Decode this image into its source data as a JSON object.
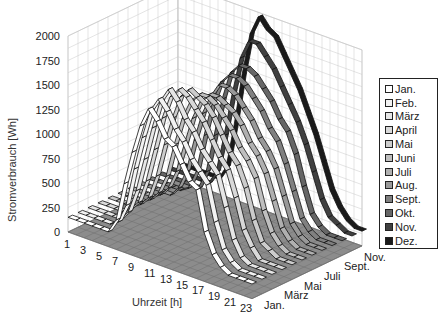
{
  "chart_data": {
    "type": "area",
    "subtype": "3d-ribbon",
    "title": "",
    "xlabel": "Uhrzeit [h]",
    "ylabel": "Monat",
    "zlabel": "Stromverbrauch [Wh]",
    "zlim": [
      0,
      2000
    ],
    "z_ticks": [
      "0",
      "250",
      "500",
      "750",
      "1000",
      "1250",
      "1500",
      "1750",
      "2000"
    ],
    "x_ticks": [
      "1",
      "3",
      "5",
      "7",
      "9",
      "11",
      "13",
      "15",
      "17",
      "19",
      "21",
      "23"
    ],
    "y_ticks": [
      "Jan.",
      "März",
      "Mai",
      "Juli",
      "Sept.",
      "Nov."
    ],
    "grid": true,
    "legend_position": "right",
    "x": [
      1,
      2,
      3,
      4,
      5,
      6,
      7,
      8,
      9,
      10,
      11,
      12,
      13,
      14,
      15,
      16,
      17,
      18,
      19,
      20,
      21,
      22,
      23,
      24
    ],
    "series": [
      {
        "name": "Jan.",
        "color": "#ffffff",
        "values": [
          150,
          150,
          150,
          150,
          150,
          150,
          300,
          700,
          1050,
          1350,
          1550,
          1450,
          1300,
          1250,
          1100,
          950,
          900,
          500,
          300,
          200,
          150,
          150,
          150,
          150
        ]
      },
      {
        "name": "Feb.",
        "color": "#f2f2f2",
        "values": [
          150,
          150,
          150,
          150,
          150,
          200,
          400,
          800,
          1150,
          1450,
          1600,
          1500,
          1350,
          1250,
          1100,
          1000,
          900,
          550,
          300,
          200,
          150,
          150,
          150,
          150
        ]
      },
      {
        "name": "März",
        "color": "#e6e6e6",
        "values": [
          150,
          150,
          150,
          150,
          150,
          250,
          500,
          850,
          1200,
          1500,
          1650,
          1550,
          1400,
          1300,
          1150,
          1050,
          950,
          650,
          350,
          200,
          150,
          150,
          150,
          150
        ]
      },
      {
        "name": "April",
        "color": "#d9d9d9",
        "values": [
          150,
          150,
          150,
          150,
          200,
          300,
          550,
          900,
          1250,
          1500,
          1600,
          1550,
          1450,
          1350,
          1200,
          1050,
          950,
          700,
          400,
          250,
          150,
          150,
          150,
          150
        ]
      },
      {
        "name": "Mai",
        "color": "#cccccc",
        "values": [
          150,
          150,
          150,
          150,
          200,
          300,
          550,
          900,
          1200,
          1450,
          1550,
          1500,
          1450,
          1350,
          1200,
          1050,
          950,
          750,
          450,
          250,
          200,
          150,
          150,
          150
        ]
      },
      {
        "name": "Juni",
        "color": "#bfbfbf",
        "values": [
          150,
          150,
          150,
          150,
          200,
          300,
          500,
          850,
          1150,
          1350,
          1450,
          1450,
          1400,
          1300,
          1200,
          1050,
          950,
          800,
          500,
          300,
          200,
          150,
          150,
          150
        ]
      },
      {
        "name": "Juli",
        "color": "#b0b0b0",
        "values": [
          150,
          150,
          150,
          150,
          200,
          300,
          500,
          800,
          1100,
          1300,
          1400,
          1400,
          1350,
          1300,
          1200,
          1050,
          950,
          800,
          550,
          300,
          200,
          150,
          150,
          150
        ]
      },
      {
        "name": "Aug.",
        "color": "#999999",
        "values": [
          150,
          150,
          150,
          150,
          150,
          250,
          450,
          800,
          1100,
          1300,
          1450,
          1450,
          1400,
          1300,
          1200,
          1050,
          950,
          800,
          550,
          300,
          200,
          150,
          150,
          150
        ]
      },
      {
        "name": "Sept.",
        "color": "#808080",
        "values": [
          150,
          150,
          150,
          150,
          150,
          200,
          400,
          800,
          1150,
          1400,
          1500,
          1500,
          1450,
          1350,
          1250,
          1100,
          1000,
          800,
          550,
          300,
          200,
          150,
          150,
          150
        ]
      },
      {
        "name": "Okt.",
        "color": "#666666",
        "values": [
          150,
          150,
          150,
          150,
          150,
          150,
          350,
          750,
          1150,
          1450,
          1550,
          1550,
          1500,
          1400,
          1300,
          1150,
          1050,
          850,
          550,
          300,
          200,
          150,
          150,
          150
        ]
      },
      {
        "name": "Nov.",
        "color": "#404040",
        "values": [
          150,
          150,
          150,
          150,
          150,
          150,
          300,
          700,
          1150,
          1550,
          1750,
          1750,
          1650,
          1550,
          1400,
          1250,
          1100,
          900,
          650,
          400,
          250,
          200,
          150,
          150
        ]
      },
      {
        "name": "Dez.",
        "color": "#1a1a1a",
        "values": [
          150,
          150,
          150,
          150,
          150,
          150,
          300,
          750,
          1300,
          1750,
          1950,
          1850,
          1800,
          1650,
          1500,
          1350,
          1150,
          950,
          700,
          450,
          300,
          200,
          150,
          150
        ]
      }
    ]
  },
  "legend": {
    "items": [
      {
        "label": "Jan.",
        "color": "#ffffff"
      },
      {
        "label": "Feb.",
        "color": "#f2f2f2"
      },
      {
        "label": "März",
        "color": "#e6e6e6"
      },
      {
        "label": "April",
        "color": "#d9d9d9"
      },
      {
        "label": "Mai",
        "color": "#cccccc"
      },
      {
        "label": "Juni",
        "color": "#bfbfbf"
      },
      {
        "label": "Juli",
        "color": "#b0b0b0"
      },
      {
        "label": "Aug.",
        "color": "#999999"
      },
      {
        "label": "Sept.",
        "color": "#808080"
      },
      {
        "label": "Okt.",
        "color": "#666666"
      },
      {
        "label": "Nov.",
        "color": "#404040"
      },
      {
        "label": "Dez.",
        "color": "#1a1a1a"
      }
    ]
  }
}
